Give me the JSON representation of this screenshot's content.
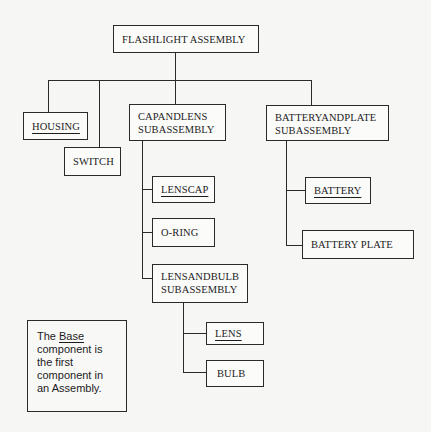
{
  "diagram": {
    "type": "assembly-tree",
    "root": {
      "label": "FLASHLIGHT ASSEMBLY"
    },
    "level1": {
      "housing": {
        "label": "HOUSING",
        "base": true
      },
      "switch": {
        "label": "SWITCH",
        "base": false
      },
      "capandlens": {
        "line1": "CAPANDLENS",
        "line2": "SUBASSEMBLY"
      },
      "batteryandplate": {
        "line1": "BATTERYANDPLATE",
        "line2": "SUBASSEMBLY"
      }
    },
    "capandlens_children": {
      "lenscap": {
        "label": "LENSCAP",
        "base": true
      },
      "oring": {
        "label": "O-RING",
        "base": false
      },
      "lensandbulb": {
        "line1": "LENSANDBULB",
        "line2": "SUBASSEMBLY"
      }
    },
    "lensandbulb_children": {
      "lens": {
        "label": "LENS",
        "base": true
      },
      "bulb": {
        "label": "BULB",
        "base": false
      }
    },
    "batteryandplate_children": {
      "battery": {
        "label": "BATTERY",
        "base": true
      },
      "batteryplate": {
        "label": "BATTERY PLATE",
        "base": false
      }
    },
    "note": {
      "prefix": "The ",
      "keyword": "Base",
      "line2": "component is",
      "line3": "the first",
      "line4": "component in",
      "line5": "an Assembly."
    }
  }
}
